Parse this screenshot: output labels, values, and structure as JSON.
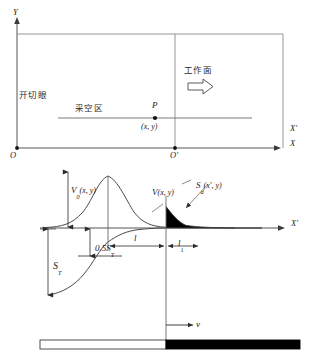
{
  "figure": {
    "title_present": false,
    "colors": {
      "line": "#555555",
      "curve": "#4a4a4a",
      "dim": "#2b2b2b",
      "fill_dark": "#000000",
      "text": "#1a1a1a",
      "background": "#ffffff"
    }
  },
  "upper_plan": {
    "labels": {
      "open_off_cut": "开切眼",
      "goaf": "采空区",
      "working_face": "工作面",
      "point": "P",
      "point_coords": "(x, y)"
    },
    "axes": {
      "y_axis": "Y",
      "x_axis": "X",
      "x_prime_axis": "X'",
      "origin": "O",
      "origin_prime": "O'"
    }
  },
  "lower_profile": {
    "axes": {
      "x_prime_axis": "X'"
    },
    "curve_labels": {
      "v0": "V",
      "v0_sub": "0",
      "v0_args": "(x, y)",
      "v": "V",
      "v_args": "(x, y)",
      "sd": "S",
      "sd_sub": "d",
      "sd_args": "(x', y)"
    },
    "dimensions": {
      "half_subsidence": "0.5S",
      "half_subsidence_sub": "T",
      "total_subsidence": "S",
      "total_subsidence_sub": "T",
      "offset_l": "l",
      "offset_l1": "l",
      "offset_l1_sub": "1"
    },
    "velocity": {
      "label": "v"
    }
  }
}
